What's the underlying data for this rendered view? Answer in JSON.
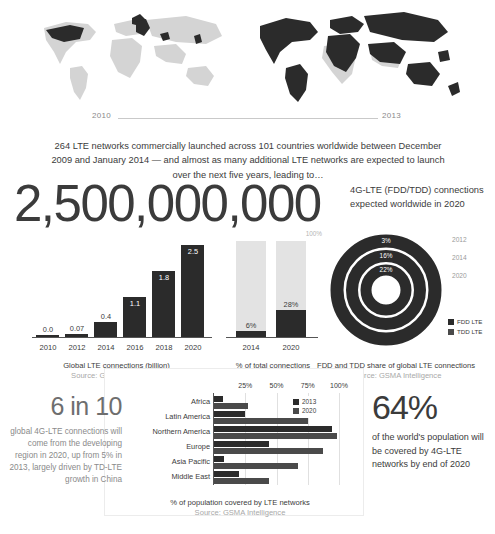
{
  "maps": {
    "left_year": "2010",
    "right_year": "2013"
  },
  "headline": {
    "copy": "264 LTE networks commercially launched across 101 countries worldwide between December 2009 and January 2014 — and almost as many additional LTE networks are expected to launch over the next five years, leading to…",
    "big_number": "2,500,000,000",
    "caption": "4G-LTE (FDD/TDD) connections expected worldwide in 2020"
  },
  "source": "Source: GSMA Intelligence",
  "chart_data": [
    {
      "type": "bar",
      "title": "Global LTE connections (billion)",
      "subtitle": "Source: GSMA Intelligence",
      "categories": [
        "2010",
        "2012",
        "2014",
        "2016",
        "2018",
        "2020"
      ],
      "values": [
        0.0,
        0.07,
        0.4,
        1.1,
        1.8,
        2.5
      ],
      "value_labels": [
        "0.0",
        "0.07",
        "0.4",
        "1.1",
        "1.8",
        "2.5"
      ],
      "xlabel": "",
      "ylabel": "Connections (billion)",
      "ylim": [
        0,
        2.5
      ],
      "grid": false,
      "legend": "none"
    },
    {
      "type": "bar",
      "title": "% of total connections",
      "subtitle": "Source: GSMA Intelligence",
      "categories": [
        "2014",
        "2020"
      ],
      "values": [
        6,
        28
      ],
      "value_labels": [
        "6%",
        "28%"
      ],
      "reference_label": "100%",
      "reference_value": 100,
      "xlabel": "",
      "ylabel": "% of total connections",
      "ylim": [
        0,
        100
      ],
      "grid": false,
      "legend": "none"
    },
    {
      "type": "pie",
      "title": "FDD and TDD share of global LTE connections",
      "subtitle": "Source: GSMA Intelligence",
      "rings": [
        {
          "year": "2012",
          "tdd_label": "3%",
          "tdd_value": 3,
          "fdd_value": 97
        },
        {
          "year": "2014",
          "tdd_label": "16%",
          "tdd_value": 16,
          "fdd_value": 84
        },
        {
          "year": "2020",
          "tdd_label": "22%",
          "tdd_value": 22,
          "fdd_value": 78
        }
      ],
      "legend": [
        "FDD LTE",
        "TDD LTE"
      ],
      "legend_position": "right"
    },
    {
      "type": "bar",
      "orientation": "horizontal",
      "title": "% of population covered by LTE networks",
      "subtitle": "Source: GSMA Intelligence",
      "categories": [
        "Africa",
        "Latin America",
        "Northern America",
        "Europe",
        "Asia Pacific",
        "Middle East"
      ],
      "series": [
        {
          "name": "2013",
          "values": [
            7,
            25,
            94,
            44,
            8,
            20
          ]
        },
        {
          "name": "2020",
          "values": [
            27,
            75,
            98,
            87,
            67,
            44
          ]
        }
      ],
      "ticks": [
        "25%",
        "50%",
        "75%",
        "100%"
      ],
      "tick_values": [
        25,
        50,
        75,
        100
      ],
      "xlim": [
        0,
        100
      ],
      "xlabel": "% of population",
      "ylabel": "",
      "grid": true,
      "legend_position": "top-right"
    }
  ],
  "six_in_ten": {
    "big": "6 in 10",
    "sub": "global 4G-LTE connections will come from the developing region in 2020, up from 5% in 2013, largely driven by TD-LTE growth in China"
  },
  "sixty_four": {
    "big": "64%",
    "sub": "of the world's population will be covered by 4G-LTE networks by end of 2020"
  },
  "colors": {
    "dark": "#2b2b2b",
    "light": "#e3e3e3",
    "map_base": "#d4d4d4",
    "text": "#3b3b3b",
    "muted": "#a8a8a8"
  }
}
